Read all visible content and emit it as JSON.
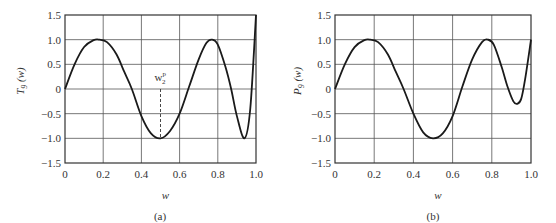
{
  "chart_data": [
    {
      "type": "line",
      "panel": "(a)",
      "title": "",
      "xlabel": "w",
      "ylabel": "T9(w)",
      "xlim": [
        0,
        1.0
      ],
      "ylim": [
        -1.5,
        1.5
      ],
      "grid": true,
      "xticks": [
        "0",
        "0.2",
        "0.4",
        "0.6",
        "0.8",
        "1.0"
      ],
      "yticks": [
        "1.5",
        "1.0",
        "0.5",
        "0",
        "-0.5",
        "-1.0",
        "-1.5"
      ],
      "annotations": [
        {
          "text": "w2p",
          "x": 0.5,
          "y": -1.0,
          "style": "dashed vertical line from y=0 to y=-1"
        }
      ],
      "series": [
        {
          "name": "T9(w)",
          "x": [
            0,
            0.05,
            0.1,
            0.15,
            0.18,
            0.22,
            0.27,
            0.31,
            0.35,
            0.4,
            0.45,
            0.5,
            0.55,
            0.6,
            0.65,
            0.7,
            0.74,
            0.77,
            0.8,
            0.84,
            0.87,
            0.9,
            0.94,
            0.97,
            1.0
          ],
          "values": [
            0,
            0.5,
            0.85,
            0.99,
            1.0,
            0.95,
            0.7,
            0.35,
            0.0,
            -0.55,
            -0.9,
            -1.0,
            -0.85,
            -0.5,
            0.05,
            0.6,
            0.93,
            1.0,
            0.9,
            0.45,
            0.0,
            -0.55,
            -1.0,
            -0.4,
            1.5
          ]
        }
      ]
    },
    {
      "type": "line",
      "panel": "(b)",
      "title": "",
      "xlabel": "w",
      "ylabel": "P9(w)",
      "xlim": [
        0,
        1.0
      ],
      "ylim": [
        -1.5,
        1.5
      ],
      "grid": true,
      "xticks": [
        "0",
        "0.2",
        "0.4",
        "0.6",
        "0.8",
        "1.0"
      ],
      "yticks": [
        "1.5",
        "1.0",
        "0.5",
        "0",
        "-0.5",
        "-1.0",
        "-1.5"
      ],
      "series": [
        {
          "name": "P9(w)",
          "x": [
            0,
            0.05,
            0.1,
            0.15,
            0.18,
            0.22,
            0.27,
            0.31,
            0.35,
            0.4,
            0.45,
            0.5,
            0.55,
            0.6,
            0.65,
            0.7,
            0.75,
            0.78,
            0.81,
            0.85,
            0.88,
            0.91,
            0.93,
            0.95,
            0.97,
            1.0
          ],
          "values": [
            0,
            0.5,
            0.85,
            0.99,
            1.0,
            0.95,
            0.7,
            0.35,
            0.0,
            -0.5,
            -0.88,
            -1.0,
            -0.9,
            -0.55,
            0.05,
            0.6,
            0.95,
            1.0,
            0.9,
            0.45,
            0.05,
            -0.25,
            -0.3,
            -0.2,
            0.2,
            1.0
          ]
        }
      ]
    }
  ],
  "panels": {
    "a": {
      "ylabel": "T",
      "ysub": "9",
      "yarg": "(w)",
      "xlabel": "w",
      "caption": "(a)",
      "annot": "w",
      "annot_sup": "p",
      "annot_sub": "2"
    },
    "b": {
      "ylabel": "P",
      "ysub": "9",
      "yarg": "(w)",
      "xlabel": "w",
      "caption": "(b)"
    }
  }
}
